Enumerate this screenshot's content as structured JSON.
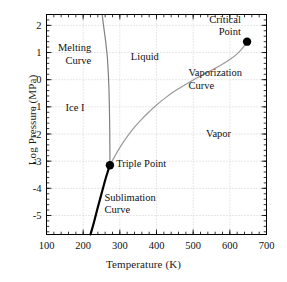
{
  "chart_data": {
    "type": "line",
    "title": "",
    "xlabel": "Temperature (K)",
    "ylabel": "Log Pressure (MPa)",
    "xlim": [
      100,
      700
    ],
    "ylim": [
      -5.7,
      2.4
    ],
    "x_major_ticks": [
      100,
      200,
      300,
      400,
      500,
      600,
      700
    ],
    "x_tick_labels": [
      "100",
      "200",
      "300",
      "400",
      "500",
      "600",
      "700"
    ],
    "x_minor_step": 20,
    "y_major_ticks": [
      2,
      1,
      0,
      -1,
      -2,
      -3,
      -4,
      -5
    ],
    "y_tick_labels": [
      "2",
      "1",
      "0",
      "-1",
      "-2",
      "-3",
      "-4",
      "-5"
    ],
    "y_minor_step": 0.2,
    "grid": "dotted",
    "legend": "none",
    "colors": {
      "melting_curve": "#808080",
      "vaporization_curve": "#999999",
      "sublimation_curve": "#000000",
      "grid": "#bbbbbb",
      "axis": "#000000",
      "point": "#000000"
    },
    "series": [
      {
        "name": "Melting Curve",
        "color": "#808080",
        "width": 1.2,
        "points": [
          [
            252.0,
            2.4
          ],
          [
            254.5,
            2.1
          ],
          [
            257.5,
            1.8
          ],
          [
            260.5,
            1.5
          ],
          [
            263.0,
            1.2
          ],
          [
            265.5,
            0.9
          ],
          [
            267.5,
            0.5
          ],
          [
            269.0,
            0.1
          ],
          [
            270.5,
            -0.4
          ],
          [
            271.5,
            -1.0
          ],
          [
            272.3,
            -1.7
          ],
          [
            272.8,
            -2.4
          ],
          [
            273.0,
            -3.15
          ]
        ]
      },
      {
        "name": "Vaporization Curve",
        "color": "#999999",
        "width": 1.2,
        "points": [
          [
            273.0,
            -3.15
          ],
          [
            285.0,
            -2.85
          ],
          [
            300.0,
            -2.5
          ],
          [
            320.0,
            -2.1
          ],
          [
            340.0,
            -1.75
          ],
          [
            360.0,
            -1.45
          ],
          [
            380.0,
            -1.18
          ],
          [
            400.0,
            -0.93
          ],
          [
            425.0,
            -0.66
          ],
          [
            450.0,
            -0.42
          ],
          [
            475.0,
            -0.21
          ],
          [
            500.0,
            -0.01
          ],
          [
            525.0,
            0.17
          ],
          [
            550.0,
            0.35
          ],
          [
            575.0,
            0.53
          ],
          [
            600.0,
            0.74
          ],
          [
            620.0,
            0.95
          ],
          [
            635.0,
            1.17
          ],
          [
            645.0,
            1.36
          ],
          [
            647.0,
            1.4
          ]
        ]
      },
      {
        "name": "Sublimation Curve",
        "color": "#000000",
        "width": 2.2,
        "points": [
          [
            220.0,
            -5.7
          ],
          [
            230.0,
            -5.22
          ],
          [
            240.0,
            -4.7
          ],
          [
            250.0,
            -4.2
          ],
          [
            260.0,
            -3.7
          ],
          [
            268.0,
            -3.35
          ],
          [
            273.0,
            -3.15
          ]
        ]
      }
    ],
    "annotations": [
      {
        "name": "melting-curve-label",
        "text": "Melting\nCurve",
        "x": 222,
        "y": 1.05,
        "align": "right"
      },
      {
        "name": "liquid-label",
        "text": "Liquid",
        "x": 330,
        "y": 0.72,
        "align": "left"
      },
      {
        "name": "ice-i-label",
        "text": "Ice I",
        "x": 152,
        "y": -1.15,
        "align": "left"
      },
      {
        "name": "vaporization-curve-label",
        "text": "Vaporization\nCurve",
        "x": 487,
        "y": 0.12,
        "align": "left"
      },
      {
        "name": "vapor-label",
        "text": "Vapor",
        "x": 535,
        "y": -2.1,
        "align": "left"
      },
      {
        "name": "critical-point-label",
        "text": "Critical\nPoint",
        "x": 630,
        "y": 2.1,
        "align": "right"
      },
      {
        "name": "triple-point-label",
        "text": "Triple Point",
        "x": 290,
        "y": -3.22,
        "align": "left"
      },
      {
        "name": "sublimation-curve-label",
        "text": "Sublimation\nCurve",
        "x": 258,
        "y": -4.45,
        "align": "left"
      }
    ],
    "markers": [
      {
        "name": "triple-point-marker",
        "label": "Triple Point",
        "x": 273,
        "y": -3.15,
        "r": 4.2,
        "color": "#000000"
      },
      {
        "name": "critical-point-marker",
        "label": "Critical Point",
        "x": 647,
        "y": 1.4,
        "r": 4.2,
        "color": "#000000"
      }
    ]
  }
}
